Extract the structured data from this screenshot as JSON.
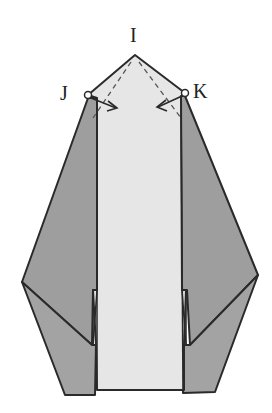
{
  "diagram": {
    "type": "origami-fold-step",
    "labels": {
      "apex": "I",
      "left_corner": "J",
      "right_corner": "K"
    },
    "colors": {
      "background": "#ffffff",
      "paper_light": "#e6e6e6",
      "paper_dark": "#9e9e9e",
      "line": "#2a2a2a",
      "fold_line": "#555555"
    },
    "annotations": [
      {
        "from": "J",
        "type": "arrow",
        "direction": "inward-down"
      },
      {
        "from": "K",
        "type": "arrow",
        "direction": "inward-down"
      },
      {
        "type": "valley-fold-line",
        "side": "left",
        "from": "I",
        "toward": "J"
      },
      {
        "type": "valley-fold-line",
        "side": "right",
        "from": "I",
        "toward": "K"
      }
    ]
  }
}
